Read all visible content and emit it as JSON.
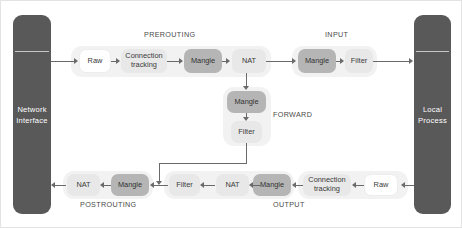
{
  "diagram": {
    "colors": {
      "endpoint_fill": "#595959",
      "group_fill": "#f2f2f2",
      "box_white": "#ffffff",
      "box_light": "#e8e8e8",
      "box_dark": "#b5b5b5",
      "connector": "#6a6a6a",
      "caption_text": "#4a4a4a",
      "background": "#ffffff"
    },
    "endpoints": {
      "left": {
        "line1": "Network",
        "line2": "Interface"
      },
      "right": {
        "line1": "Local",
        "line2": "Process"
      }
    },
    "captions": {
      "prerouting": "PREROUTING",
      "input": "INPUT",
      "forward": "FORWARD",
      "postrouting": "POSTROUTING",
      "output": "OUTPUT"
    },
    "chains": {
      "prerouting": {
        "label": "PREROUTING",
        "boxes": [
          {
            "label": "Raw",
            "style": "white"
          },
          {
            "label": "Connection tracking",
            "style": "light"
          },
          {
            "label": "Mangle",
            "style": "dark"
          },
          {
            "label": "NAT",
            "style": "light"
          }
        ]
      },
      "input": {
        "label": "INPUT",
        "boxes": [
          {
            "label": "Mangle",
            "style": "dark"
          },
          {
            "label": "Filter",
            "style": "light"
          }
        ]
      },
      "forward": {
        "label": "FORWARD",
        "boxes": [
          {
            "label": "Mangle",
            "style": "dark"
          },
          {
            "label": "Filter",
            "style": "light"
          }
        ]
      },
      "postrouting": {
        "label": "POSTROUTING",
        "boxes": [
          {
            "label": "NAT",
            "style": "light"
          },
          {
            "label": "Mangle",
            "style": "dark"
          }
        ]
      },
      "output": {
        "label": "OUTPUT",
        "boxes": [
          {
            "label": "Filter",
            "style": "light"
          },
          {
            "label": "NAT",
            "style": "light"
          },
          {
            "label": "Mangle",
            "style": "dark"
          },
          {
            "label": "Connection tracking",
            "style": "light"
          },
          {
            "label": "Raw",
            "style": "white"
          }
        ]
      }
    }
  }
}
